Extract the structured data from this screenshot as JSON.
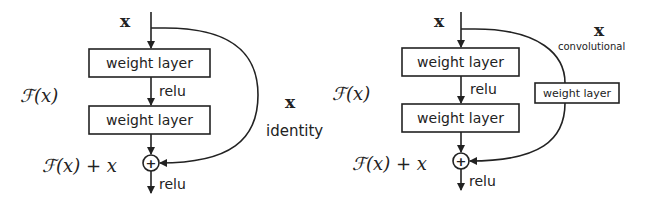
{
  "diagrams": [
    {
      "name": "identity-shortcut",
      "input_label": "x",
      "layer1": "weight layer",
      "mid_act": "relu",
      "layer2": "weight layer",
      "residual_label": "ℱ(x)",
      "sum_label": "ℱ(x) + x",
      "out_act": "relu",
      "shortcut_label": "x",
      "shortcut_type": "identity",
      "plus": "+"
    },
    {
      "name": "convolutional-shortcut",
      "input_label": "x",
      "layer1": "weight layer",
      "mid_act": "relu",
      "layer2": "weight layer",
      "residual_label": "ℱ(x)",
      "sum_label": "ℱ(x) + x",
      "out_act": "relu",
      "shortcut_label": "x",
      "shortcut_type": "convolutional",
      "shortcut_layer": "weight layer",
      "plus": "+"
    }
  ]
}
